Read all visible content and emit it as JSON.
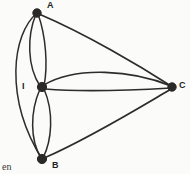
{
  "figure": {
    "background_color": "#fbfbfa",
    "ink_color": "#2e2c2b",
    "width": 190,
    "height": 174,
    "type": "multigraph-diagram"
  },
  "nodes": [
    {
      "id": "A",
      "label": "A",
      "x": 37,
      "y": 13,
      "label_x": 47,
      "label_y": 1,
      "radius": 4.2
    },
    {
      "id": "I",
      "label": "I",
      "x": 42,
      "y": 87,
      "label_x": 22,
      "label_y": 82,
      "radius": 4.6
    },
    {
      "id": "B",
      "label": "B",
      "x": 42,
      "y": 159,
      "label_x": 52,
      "label_y": 161,
      "radius": 4.6
    },
    {
      "id": "C",
      "label": "C",
      "x": 172,
      "y": 87,
      "label_x": 179,
      "label_y": 81,
      "radius": 4.2
    }
  ],
  "edges": [
    {
      "id": "e1",
      "from": "A",
      "to": "I",
      "style": "curve-left",
      "width": 1.5
    },
    {
      "id": "e2",
      "from": "A",
      "to": "I",
      "style": "curve-right",
      "width": 1.5
    },
    {
      "id": "e3",
      "from": "A",
      "to": "B",
      "style": "arc-far-left",
      "width": 1.5
    },
    {
      "id": "e4",
      "from": "A",
      "to": "C",
      "style": "bowed",
      "width": 1.8
    },
    {
      "id": "e5",
      "from": "I",
      "to": "B",
      "style": "curve-left",
      "width": 1.5
    },
    {
      "id": "e6",
      "from": "I",
      "to": "B",
      "style": "curve-right",
      "width": 1.5
    },
    {
      "id": "e7",
      "from": "I",
      "to": "C",
      "style": "arc-up",
      "width": 1.6
    },
    {
      "id": "e8",
      "from": "I",
      "to": "C",
      "style": "near-straight",
      "width": 1.6
    },
    {
      "id": "e9",
      "from": "B",
      "to": "C",
      "style": "bowed",
      "width": 1.8
    }
  ],
  "caption": {
    "fragment_text": "en",
    "x": 2,
    "y": 162
  }
}
